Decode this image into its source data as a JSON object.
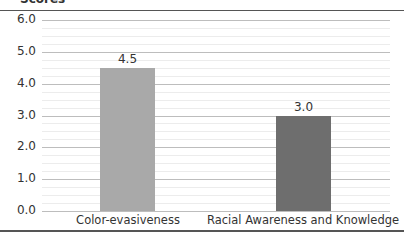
{
  "chart_data": {
    "type": "bar",
    "title": "Scores",
    "xlabel": "",
    "ylabel": "Scores",
    "categories": [
      "Color-evasiveness",
      "Racial Awareness and Knowledge"
    ],
    "values": [
      4.5,
      3.0
    ],
    "value_labels": [
      "4.5",
      "3.0"
    ],
    "bar_colors": [
      "#a9a9a9",
      "#6e6e6e"
    ],
    "ylim": [
      0,
      6
    ],
    "yticks": [
      "0.0",
      "1.0",
      "2.0",
      "3.0",
      "4.0",
      "5.0",
      "6.0"
    ],
    "grid": true,
    "legend": null
  }
}
